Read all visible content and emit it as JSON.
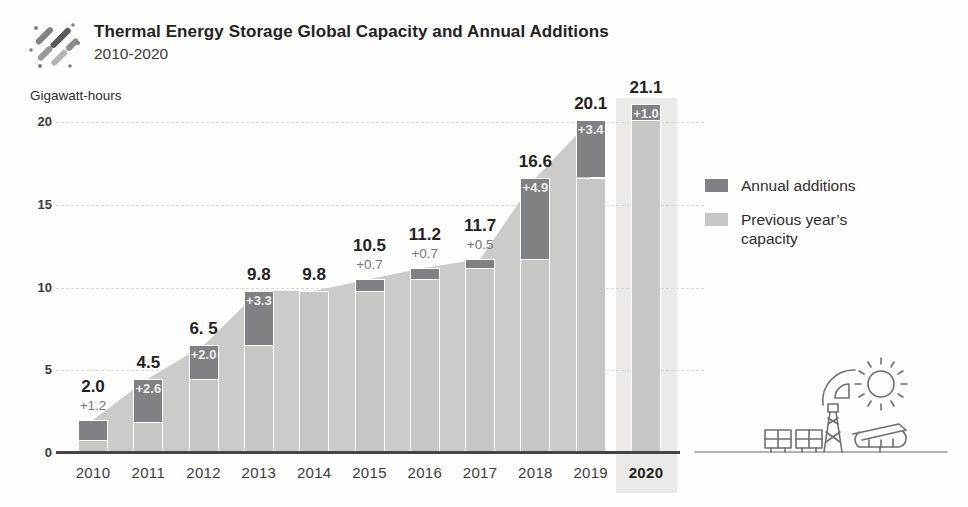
{
  "header": {
    "title": "Thermal Energy Storage Global Capacity and Annual Additions",
    "subtitle": "2010-2020",
    "logo": "diagonal-dashes-logo"
  },
  "chart_data": {
    "type": "bar",
    "variant": "stacked-bars-with-background-area-silhouette",
    "title": "Thermal Energy Storage Global Capacity and Annual Additions",
    "subtitle": "2010-2020",
    "ylabel": "Gigawatt-hours",
    "yticks": [
      "0",
      "5",
      "10",
      "15",
      "20"
    ],
    "ylim": [
      0,
      21.5
    ],
    "grid": "horizontal dashed lines at 5, 10, 15, 20",
    "categories": [
      "2010",
      "2011",
      "2012",
      "2013",
      "2014",
      "2015",
      "2016",
      "2017",
      "2018",
      "2019",
      "2020"
    ],
    "years": [
      {
        "year": "2010",
        "total": 2.0,
        "previous": 0.8,
        "addition": 1.2,
        "total_label": "2.0",
        "addition_label": "+1.2",
        "addition_label_position": "outside",
        "highlighted": false
      },
      {
        "year": "2011",
        "total": 4.5,
        "previous": 1.9,
        "addition": 2.6,
        "total_label": "4.5",
        "addition_label": "+2.6",
        "addition_label_position": "inside",
        "highlighted": false
      },
      {
        "year": "2012",
        "total": 6.5,
        "previous": 4.5,
        "addition": 2.0,
        "total_label": "6. 5",
        "addition_label": "+2.0",
        "addition_label_position": "inside",
        "highlighted": false
      },
      {
        "year": "2013",
        "total": 9.8,
        "previous": 6.5,
        "addition": 3.3,
        "total_label": "9.8",
        "addition_label": "+3.3",
        "addition_label_position": "inside",
        "highlighted": false
      },
      {
        "year": "2014",
        "total": 9.8,
        "previous": 9.8,
        "addition": 0.0,
        "total_label": "9.8",
        "addition_label": "",
        "addition_label_position": "none",
        "highlighted": false
      },
      {
        "year": "2015",
        "total": 10.5,
        "previous": 9.8,
        "addition": 0.7,
        "total_label": "10.5",
        "addition_label": "+0.7",
        "addition_label_position": "outside",
        "highlighted": false
      },
      {
        "year": "2016",
        "total": 11.2,
        "previous": 10.5,
        "addition": 0.7,
        "total_label": "11.2",
        "addition_label": "+0.7",
        "addition_label_position": "outside",
        "highlighted": false
      },
      {
        "year": "2017",
        "total": 11.7,
        "previous": 11.2,
        "addition": 0.5,
        "total_label": "11.7",
        "addition_label": "+0.5",
        "addition_label_position": "outside",
        "highlighted": false
      },
      {
        "year": "2018",
        "total": 16.6,
        "previous": 11.7,
        "addition": 4.9,
        "total_label": "16.6",
        "addition_label": "+4.9",
        "addition_label_position": "inside",
        "highlighted": false
      },
      {
        "year": "2019",
        "total": 20.1,
        "previous": 16.6,
        "addition": 3.4,
        "total_label": "20.1",
        "addition_label": "+3.4",
        "addition_label_position": "inside",
        "highlighted": false
      },
      {
        "year": "2020",
        "total": 21.1,
        "previous": 20.1,
        "addition": 1.0,
        "total_label": "21.1",
        "addition_label": "+1.0",
        "addition_label_position": "inside",
        "highlighted": true
      }
    ],
    "area_series": {
      "name": "capacity-silhouette",
      "years": [
        "2010",
        "2011",
        "2012",
        "2013",
        "2014",
        "2015",
        "2016",
        "2017",
        "2018",
        "2019"
      ],
      "values": [
        2.0,
        4.5,
        6.5,
        9.8,
        9.8,
        10.5,
        11.2,
        11.7,
        16.6,
        20.1
      ]
    },
    "legend": {
      "position": "right",
      "items": [
        {
          "label": "Annual additions",
          "color": "#808184"
        },
        {
          "label": "Previous year’s capacity",
          "color": "#c6c7c5"
        }
      ]
    },
    "colors": {
      "addition": "#808184",
      "previous": "#c6c7c5",
      "area": "#cbccc9",
      "highlight_band": "#eceae7",
      "axis": "#454545",
      "ground_line": "#9a9a9a"
    }
  },
  "footer_illustration": {
    "icons": [
      "solar-panel",
      "solar-panel",
      "transmission-tower",
      "solar-collector-dish",
      "sun",
      "parabolic-trough"
    ]
  }
}
